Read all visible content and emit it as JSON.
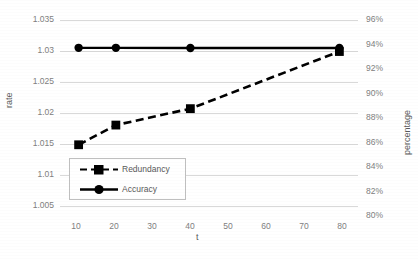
{
  "chart_data": {
    "type": "line",
    "title": "",
    "xlabel": "t",
    "ylabel": "rate",
    "y2label": "percentage",
    "grid": true,
    "legend_position": "inside-bottom-left",
    "x": [
      10,
      20,
      40,
      80
    ],
    "xticks": [
      10,
      20,
      30,
      40,
      50,
      60,
      70,
      80
    ],
    "xtick_labels": [
      "10",
      "20",
      "30",
      "40",
      "50",
      "60",
      "70",
      "80"
    ],
    "xlim": [
      5,
      85
    ],
    "ylim": [
      1.005,
      1.035
    ],
    "yticks": [
      1.005,
      1.01,
      1.015,
      1.02,
      1.025,
      1.03,
      1.035
    ],
    "ytick_labels": [
      "1.005",
      "1.01",
      "1.015",
      "1.02",
      "1.025",
      "1.03",
      "1.035"
    ],
    "y2lim": [
      0.8,
      0.96
    ],
    "y2ticks": [
      0.8,
      0.82,
      0.84,
      0.86,
      0.88,
      0.9,
      0.92,
      0.94,
      0.96
    ],
    "y2tick_labels": [
      "80%",
      "82%",
      "84%",
      "86%",
      "88%",
      "90%",
      "92%",
      "94%",
      "96%"
    ],
    "series": [
      {
        "name": "Redundancy",
        "axis": "left",
        "style": "dashed",
        "marker": "square",
        "color": "#000000",
        "values": [
          1.016,
          1.019,
          1.0215,
          1.0302
        ]
      },
      {
        "name": "Accuracy",
        "axis": "right",
        "style": "solid",
        "marker": "circle",
        "color": "#000000",
        "values": [
          0.9374,
          0.9374,
          0.9372,
          0.9373
        ]
      }
    ]
  },
  "legend": {
    "items": [
      {
        "label": "Redundancy",
        "key": "dashed-square-key"
      },
      {
        "label": "Accuracy",
        "key": "solid-circle-key"
      }
    ]
  },
  "colors": {
    "axis_text": "#808080",
    "axis_title": "#595959",
    "gridline": "#d9d9d9",
    "series": "#000000",
    "background": "#ffffff"
  }
}
